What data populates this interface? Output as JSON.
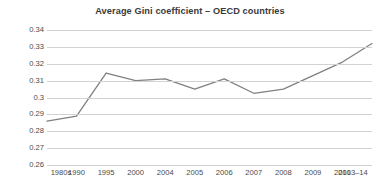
{
  "chart_data": {
    "type": "line",
    "title": "Average Gini coefficient – OECD countries",
    "xlabel": "",
    "ylabel": "",
    "categories": [
      "1980s",
      "1990",
      "1995",
      "2000",
      "2004",
      "2005",
      "2006",
      "2007",
      "2008",
      "2009",
      "2010",
      "2013–14"
    ],
    "values": [
      0.286,
      0.289,
      0.3145,
      0.31,
      0.311,
      0.305,
      0.311,
      0.3025,
      0.305,
      0.313,
      0.321,
      0.332
    ],
    "series": [
      {
        "name": "Average Gini coefficient",
        "values": [
          0.286,
          0.289,
          0.3145,
          0.31,
          0.311,
          0.305,
          0.311,
          0.3025,
          0.305,
          0.313,
          0.321,
          0.332
        ]
      }
    ],
    "ylim": [
      0.26,
      0.34
    ],
    "ytick_labels": [
      "0.34",
      "0.33",
      "0.32",
      "0.31",
      "0.3",
      "0.29",
      "0.28",
      "0.27",
      "0.26"
    ],
    "ytick_values": [
      0.34,
      0.33,
      0.32,
      0.31,
      0.3,
      0.29,
      0.28,
      0.27,
      0.26
    ],
    "grid": true,
    "legend": false,
    "line_color": "#808080",
    "grid_color": "#d2d2d2",
    "background_color": "#ffffff",
    "title_color": "#3a3a3a"
  }
}
